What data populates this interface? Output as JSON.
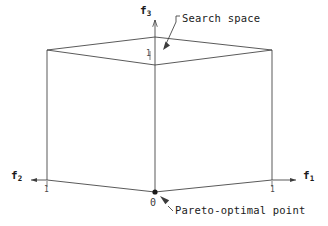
{
  "figure": {
    "kind": "3d-cube-search-space-diagram",
    "background_color": "#ffffff",
    "line_color": "#3c3c3c",
    "text_color": "#1a1a1a"
  },
  "axes": {
    "f1": {
      "name": "f",
      "subscript": "1",
      "tick_label": "1",
      "direction": "right"
    },
    "f2": {
      "name": "f",
      "subscript": "2",
      "tick_label": "1",
      "direction": "left"
    },
    "f3": {
      "name": "f",
      "subscript": "3",
      "tick_label": "1",
      "direction": "up"
    }
  },
  "origin": {
    "label": "0",
    "marker": "filled-dot"
  },
  "annotations": {
    "search_space": {
      "text": "Search space",
      "points_to": "cube-top-face"
    },
    "pareto_point": {
      "text": "Pareto-optimal point",
      "points_to": "origin"
    }
  },
  "geometry": {
    "cube": {
      "top_left": [
        47,
        50
      ],
      "top_back": [
        155,
        37
      ],
      "top_right": [
        272,
        50
      ],
      "top_front": [
        155,
        65
      ],
      "bot_left": [
        47,
        180
      ],
      "bot_front": [
        155,
        192
      ],
      "bot_right": [
        272,
        180
      ]
    }
  }
}
